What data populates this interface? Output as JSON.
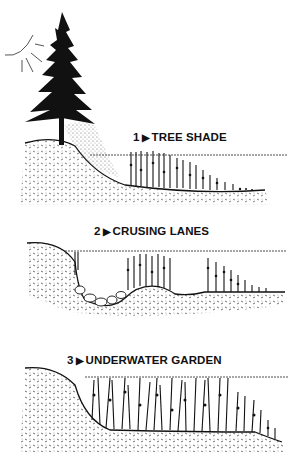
{
  "illustration": {
    "colors": {
      "ink": "#111111",
      "background": "#ffffff"
    },
    "panels": [
      {
        "number": "1",
        "arrow": "▶",
        "title": "TREE SHADE"
      },
      {
        "number": "2",
        "arrow": "▶",
        "title": "CRUSING LANES"
      },
      {
        "number": "3",
        "arrow": "▶",
        "title": "UNDERWATER GARDEN"
      }
    ],
    "icons": [
      "sun-icon",
      "tree-icon"
    ]
  }
}
